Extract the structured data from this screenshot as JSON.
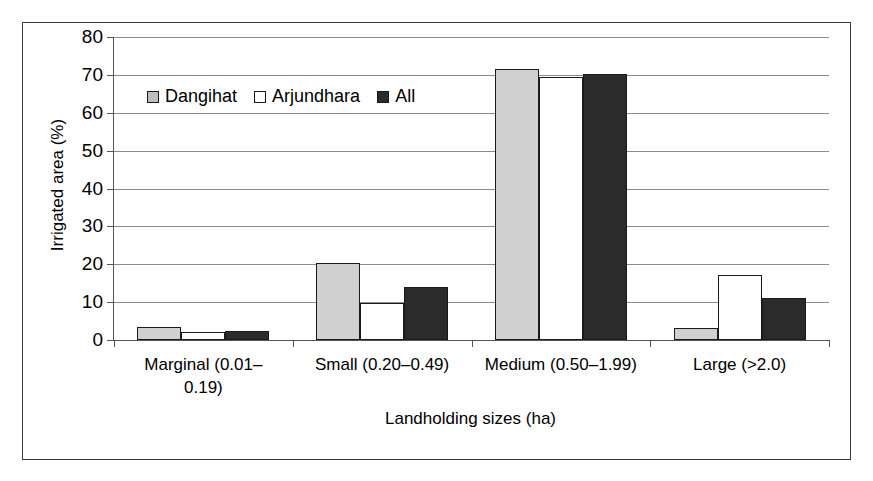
{
  "chart_data": {
    "type": "bar",
    "title": "",
    "xlabel": "Landholding sizes (ha)",
    "ylabel": "Irrigated area (%)",
    "categories": [
      "Marginal (0.01–0.19)",
      "Small (0.20–0.49)",
      "Medium (0.50–1.99)",
      "Large (>2.0)"
    ],
    "category_lines": [
      [
        "Marginal (0.01–",
        "0.19)"
      ],
      [
        "Small (0.20–0.49)"
      ],
      [
        "Medium (0.50–1.99)"
      ],
      [
        "Large (>2.0)"
      ]
    ],
    "series": [
      {
        "name": "Dangihat",
        "color": "#d0d0d0",
        "values": [
          3.4,
          20.3,
          71.6,
          3.3
        ]
      },
      {
        "name": "Arjundhara",
        "color": "#ffffff",
        "values": [
          2.2,
          9.7,
          69.5,
          17.2
        ]
      },
      {
        "name": "All",
        "color": "#2b2b2b",
        "values": [
          2.5,
          14.1,
          70.2,
          11.0
        ]
      }
    ],
    "ylim": [
      0,
      80
    ],
    "yticks": [
      0,
      10,
      20,
      30,
      40,
      50,
      60,
      70,
      80
    ],
    "ytick_labels": [
      "0",
      "10",
      "20",
      "30",
      "40",
      "50",
      "60",
      "70",
      "80"
    ],
    "grid": "horizontal",
    "legend_position": "upper-left-inside"
  }
}
